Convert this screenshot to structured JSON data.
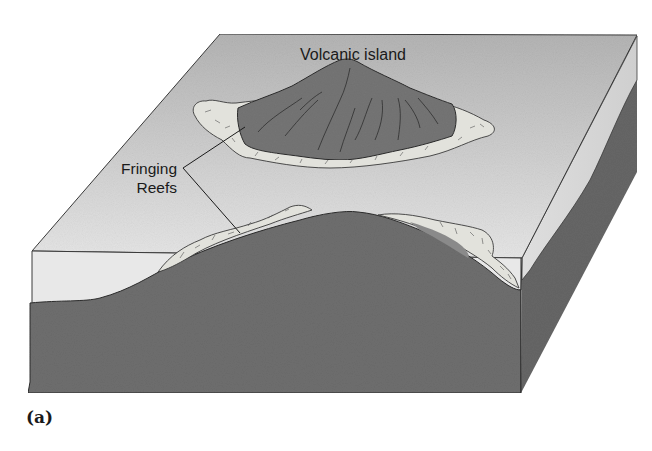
{
  "figure": {
    "panel_label": "(a)",
    "labels": {
      "volcanic_island": "Volcanic island",
      "fringing_line1": "Fringing",
      "fringing_line2": "Reefs"
    },
    "colors": {
      "background": "#ffffff",
      "water_top_back": "#b4b4b4",
      "water_top_front": "#e6e6e6",
      "water_section": "#e8e8e8",
      "rock": "#6e6e6e",
      "rock_side": "#666666",
      "island": "#757575",
      "reef": "#e2e2dc",
      "outline": "#2a2a2a"
    }
  }
}
